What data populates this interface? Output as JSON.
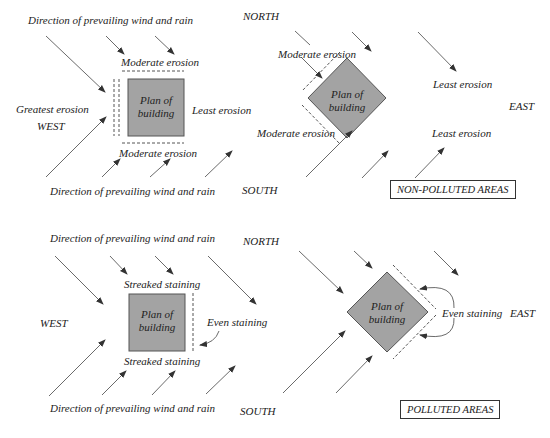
{
  "colors": {
    "building_fill": "#a3a3a3",
    "building_stroke": "#555555",
    "arrow": "#444444",
    "dash": "#555555",
    "text": "#222222"
  },
  "panels": {
    "top_left": {
      "wind_label_top": "Direction of prevailing wind and rain",
      "wind_label_bottom": "Direction of prevailing wind and rain",
      "building_line1": "Plan of",
      "building_line2": "building",
      "north_face": "Moderate erosion",
      "south_face": "Moderate erosion",
      "west_face": "Greatest erosion",
      "east_face": "Least erosion",
      "compass_west": "WEST"
    },
    "top_right": {
      "compass_north": "NORTH",
      "compass_south": "SOUTH",
      "compass_east": "EAST",
      "building_line1": "Plan of",
      "building_line2": "building",
      "nw_face": "Moderate erosion",
      "sw_face": "Moderate erosion",
      "ne_face": "Least erosion",
      "se_face": "Least erosion",
      "area_label": "NON-POLLUTED AREAS"
    },
    "bottom_left": {
      "wind_label_top": "Direction of prevailing wind and rain",
      "wind_label_bottom": "Direction of prevailing wind and rain",
      "building_line1": "Plan of",
      "building_line2": "building",
      "north_face": "Streaked staining",
      "south_face": "Streaked staining",
      "east_face": "Even staining",
      "compass_west": "WEST"
    },
    "bottom_right": {
      "compass_north": "NORTH",
      "compass_south": "SOUTH",
      "compass_east": "EAST",
      "building_line1": "Plan of",
      "building_line2": "building",
      "east_face": "Even staining",
      "area_label": "POLLUTED AREAS"
    }
  }
}
